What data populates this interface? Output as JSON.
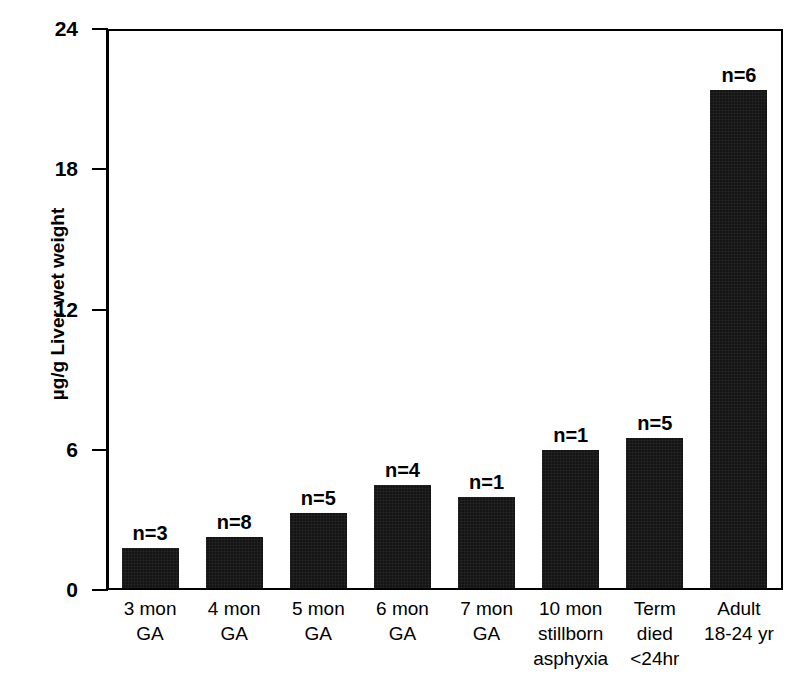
{
  "chart_data": {
    "type": "bar",
    "title": "",
    "subtitle": "",
    "xlabel": "",
    "ylabel": "µg/g Liver wet weight",
    "ylim": [
      0,
      24
    ],
    "yticks": [
      0,
      6,
      12,
      18,
      24
    ],
    "ytick_labels": [
      "0",
      "6",
      "12",
      "18",
      "24"
    ],
    "grid": false,
    "legend": false,
    "legend_position": "none",
    "bar_color": "#141414",
    "axis_color": "#000000",
    "categories": [
      "3 mon GA",
      "4 mon GA",
      "5 mon GA",
      "6 mon GA",
      "7 mon GA",
      "10 mon stillborn asphyxia",
      "Term died <24hr",
      "Adult 18-24 yr"
    ],
    "category_lines": [
      [
        "3 mon",
        "GA"
      ],
      [
        "4 mon",
        "GA"
      ],
      [
        "5 mon",
        "GA"
      ],
      [
        "6 mon",
        "GA"
      ],
      [
        "7 mon",
        "GA"
      ],
      [
        "10 mon",
        "stillborn",
        "asphyxia"
      ],
      [
        "Term",
        "died",
        "<24hr"
      ],
      [
        "Adult",
        "18-24 yr"
      ]
    ],
    "values": [
      1.7,
      2.2,
      3.2,
      4.4,
      3.9,
      5.9,
      6.4,
      21.3
    ],
    "annotations": [
      "n=3",
      "n=8",
      "n=5",
      "n=4",
      "n=1",
      "n=1",
      "n=5",
      "n=6"
    ],
    "sample_sizes": [
      3,
      8,
      5,
      4,
      1,
      1,
      5,
      6
    ]
  }
}
